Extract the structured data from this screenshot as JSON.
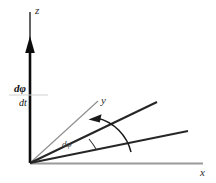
{
  "figure": {
    "background_color": "#ffffff",
    "width": 216,
    "height": 183
  },
  "colors": {
    "axis_z": "#000000",
    "axis_x": "#9a9a9a",
    "line_y": "#8c8c8c",
    "ray_dark": "#262626",
    "arc": "#1a1a1a",
    "text": "#2b2b2b"
  },
  "labels": {
    "z_axis": "z",
    "x_axis": "x",
    "y_axis": "y",
    "angle_increment": "dφ",
    "vector_numerator": "dφ",
    "vector_denominator": "dt"
  },
  "geometry": {
    "origin": {
      "x": 30,
      "y": 163
    },
    "z_axis_top": {
      "x": 30,
      "y": 12
    },
    "x_axis_end": {
      "x": 203,
      "y": 163
    },
    "y_line_end": {
      "x": 98,
      "y": 101
    },
    "ray_upper_end": {
      "x": 157,
      "y": 102
    },
    "ray_lower_end": {
      "x": 188,
      "y": 131
    },
    "arrow_head_center": {
      "x": 30,
      "y": 47
    },
    "rotation_arc_start": {
      "x": 96,
      "y": 119
    },
    "rotation_arc_end": {
      "x": 131,
      "y": 152
    }
  }
}
